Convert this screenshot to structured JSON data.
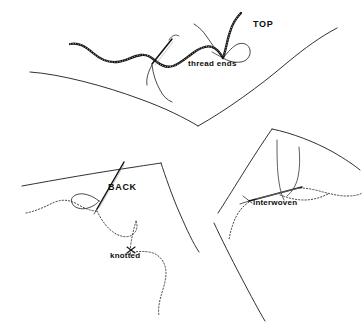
{
  "figure": {
    "background_color": "#ffffff",
    "ink_color": "#131313",
    "width": 364,
    "height": 336
  },
  "labels": {
    "top": "TOP",
    "thread_ends": "thread ends",
    "back": "BACK",
    "knotted": "knotted",
    "interwoven": "interwoven"
  },
  "panels": [
    {
      "name": "top-view-panel",
      "label": "TOP",
      "description": "Top side of fabric showing heavy textured thread running across the surface with a needle passing through and two loose thread ends forming a loop."
    },
    {
      "name": "back-view-panel",
      "label": "BACK",
      "description": "Reverse side of fabric with needle, thread loop at the needle eye and a dotted thread tail marked with a knot."
    },
    {
      "name": "interwoven-detail-panel",
      "label": "interwoven",
      "description": "Detail view of the needle weaving the thread tail back into the stitching so the join is hidden."
    }
  ]
}
